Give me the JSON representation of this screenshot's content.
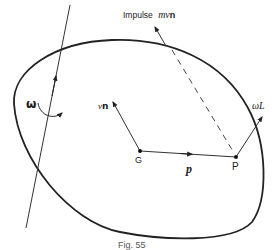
{
  "diagram": {
    "caption": "Fig. 55",
    "colors": {
      "stroke": "#222222",
      "background": "#ffffff"
    },
    "labels": {
      "impulse": "Impulse",
      "impulse_expr": "mv",
      "impulse_vec": "n",
      "omega": "ω",
      "vn_v": "v",
      "vn_n": "n",
      "g": "G",
      "p_point": "P",
      "p_vec": "p",
      "omega_l": "ωL"
    },
    "elements": [
      {
        "id": "body-outline",
        "type": "closed-curve"
      },
      {
        "id": "rotation-axis",
        "type": "line",
        "arrow": true
      },
      {
        "id": "omega-rotation",
        "type": "curved-arrow",
        "label": "ω"
      },
      {
        "id": "center-of-mass",
        "type": "point",
        "label": "G"
      },
      {
        "id": "impact-point",
        "type": "point",
        "label": "P"
      },
      {
        "id": "position-vector",
        "type": "arrow",
        "from": "G",
        "to": "P",
        "label": "p"
      },
      {
        "id": "vn-vector",
        "type": "arrow",
        "from": "G",
        "label": "vn"
      },
      {
        "id": "impulse-vector",
        "type": "arrow",
        "label": "Impulse mvn"
      },
      {
        "id": "impulse-line",
        "type": "dashed-line",
        "to": "P"
      },
      {
        "id": "omega-l-vector",
        "type": "arrow",
        "from": "P",
        "label": "ωL"
      }
    ]
  }
}
